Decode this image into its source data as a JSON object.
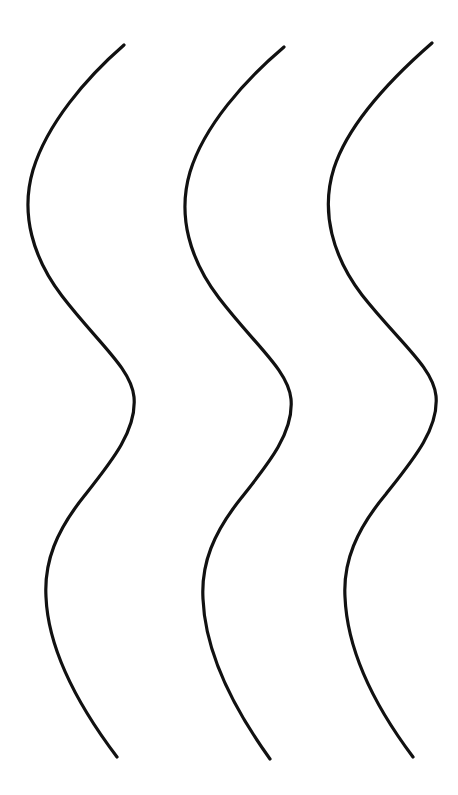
{
  "canvas": {
    "width": 458,
    "height": 795,
    "background_color": "#ffffff",
    "title": "Three vertical sinuous S-curves"
  },
  "style": {
    "stroke_color": "#111111",
    "stroke_width": 3.2,
    "stroke_linecap": "round",
    "fill": "none"
  },
  "chart_data": {
    "type": "line",
    "xlabel": "",
    "ylabel": "",
    "xlim": [
      0,
      458
    ],
    "ylim": [
      0,
      795
    ],
    "grid": false,
    "legend": "none",
    "series": [
      {
        "name": "curve-left",
        "path": "M 124 45 C 86 78 47 124 33 170 C 20 214 33 258 62 296 C 98 343 131 368 134 397 C 137 430 112 461 85 495 C 56 531 44 562 46 597 C 48 646 74 700 117 757",
        "points": [
          {
            "x": 124,
            "y": 45,
            "role": "top-tip"
          },
          {
            "x": 29,
            "y": 185,
            "role": "left-extreme-upper"
          },
          {
            "x": 134,
            "y": 396,
            "role": "right-extreme-middle"
          },
          {
            "x": 46,
            "y": 597,
            "role": "left-extreme-lower"
          },
          {
            "x": 117,
            "y": 757,
            "role": "bottom-tip"
          }
        ]
      },
      {
        "name": "curve-middle",
        "path": "M 284 47 C 245 80 204 126 190 172 C 177 216 190 260 219 298 C 255 345 288 370 291 399 C 294 432 269 463 242 497 C 213 533 201 564 203 599 C 205 648 229 702 270 759",
        "points": [
          {
            "x": 284,
            "y": 47,
            "role": "top-tip"
          },
          {
            "x": 186,
            "y": 186,
            "role": "left-extreme-upper"
          },
          {
            "x": 292,
            "y": 398,
            "role": "right-extreme-middle"
          },
          {
            "x": 203,
            "y": 599,
            "role": "left-extreme-lower"
          },
          {
            "x": 270,
            "y": 759,
            "role": "bottom-tip"
          }
        ]
      },
      {
        "name": "curve-right",
        "path": "M 432 43 C 393 77 349 122 334 168 C 320 212 333 257 362 295 C 399 342 433 367 436 396 C 439 429 413 460 386 494 C 356 530 343 562 345 597 C 347 646 371 701 413 757",
        "points": [
          {
            "x": 432,
            "y": 43,
            "role": "top-tip"
          },
          {
            "x": 330,
            "y": 182,
            "role": "left-extreme-upper"
          },
          {
            "x": 437,
            "y": 395,
            "role": "right-extreme-middle"
          },
          {
            "x": 345,
            "y": 597,
            "role": "left-extreme-lower"
          },
          {
            "x": 413,
            "y": 757,
            "role": "bottom-tip"
          }
        ]
      }
    ]
  }
}
